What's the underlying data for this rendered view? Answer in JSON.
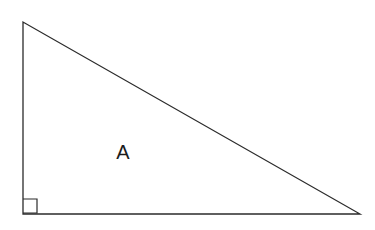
{
  "figure": {
    "kind": "geometry-figure",
    "canvas": {
      "width": 375,
      "height": 230,
      "background_color": "#ffffff"
    },
    "style": {
      "stroke_color": "#2b2b2b",
      "stroke_width": 1.3,
      "fill": "none",
      "label_color": "#1c1c1c",
      "label_font_size": 20
    },
    "triangle": {
      "name": "right-triangle",
      "vertices": [
        {
          "name": "apex-top-left",
          "x": 23,
          "y": 22
        },
        {
          "name": "right-angle-bottom-left",
          "x": 23,
          "y": 214
        },
        {
          "name": "bottom-right",
          "x": 360,
          "y": 214
        }
      ],
      "edges": [
        {
          "name": "vertical-leg",
          "from": "apex-top-left",
          "to": "right-angle-bottom-left"
        },
        {
          "name": "horizontal-leg",
          "from": "right-angle-bottom-left",
          "to": "bottom-right"
        },
        {
          "name": "hypotenuse",
          "from": "apex-top-left",
          "to": "bottom-right"
        }
      ]
    },
    "right_angle_marker": {
      "name": "right-angle-square",
      "at_vertex": "right-angle-bottom-left",
      "size": 14,
      "x": 23,
      "y": 199,
      "path": "M 23 199 L 37 199 L 37 213 L 23 213"
    },
    "labels": [
      {
        "name": "interior-area-label",
        "text": "A",
        "x": 123,
        "y": 159
      }
    ]
  }
}
